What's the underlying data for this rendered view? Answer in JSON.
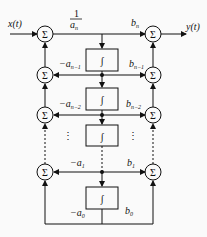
{
  "diagram": {
    "input_label": "x(t)",
    "output_label": "y(t)",
    "sum_symbol": "Σ",
    "integrator_symbol": "∫",
    "gain_top": {
      "num": "1",
      "den": "a",
      "den_sub": "n"
    },
    "left_gains": [
      {
        "text": "−a",
        "sub": "n−1"
      },
      {
        "text": "−a",
        "sub": "n−2"
      },
      {
        "text": "−a",
        "sub": "1"
      },
      {
        "text": "−a",
        "sub": "0"
      }
    ],
    "right_gains": [
      {
        "text": "b",
        "sub": "n"
      },
      {
        "text": "b",
        "sub": "n−1"
      },
      {
        "text": "b",
        "sub": "n−2"
      },
      {
        "text": "b",
        "sub": "1"
      },
      {
        "text": "b",
        "sub": "0"
      }
    ],
    "ellipsis": "⋮"
  }
}
